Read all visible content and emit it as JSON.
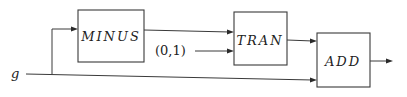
{
  "diagram": {
    "input_label": "g",
    "constant_label": "(0,1)",
    "blocks": [
      {
        "id": "minus",
        "label": "MINUS"
      },
      {
        "id": "tran",
        "label": "TRAN"
      },
      {
        "id": "add",
        "label": "ADD"
      }
    ]
  }
}
